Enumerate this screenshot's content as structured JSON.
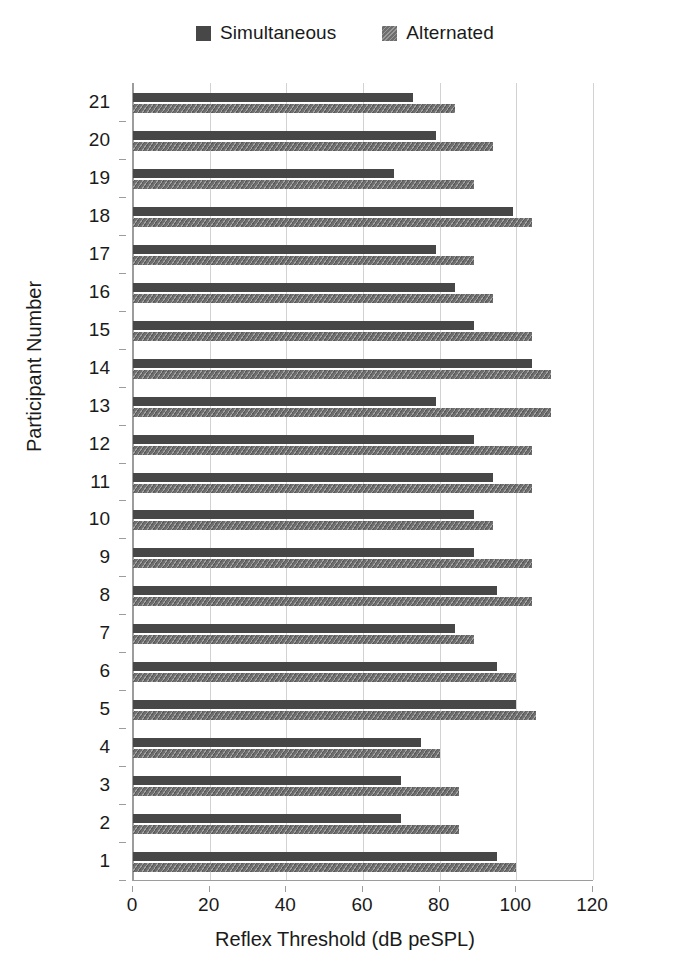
{
  "chart_data": {
    "type": "bar",
    "orientation": "horizontal",
    "title": "",
    "xlabel": "Reflex Threshold (dB peSPL)",
    "ylabel": "Participant Number",
    "xlim": [
      0,
      120
    ],
    "xticks": [
      0,
      20,
      40,
      60,
      80,
      100,
      120
    ],
    "grid": true,
    "legend_position": "top-center",
    "categories": [
      "1",
      "2",
      "3",
      "4",
      "5",
      "6",
      "7",
      "8",
      "9",
      "10",
      "11",
      "12",
      "13",
      "14",
      "15",
      "16",
      "17",
      "18",
      "19",
      "20",
      "21"
    ],
    "series": [
      {
        "name": "Simultaneous",
        "color": "#474747",
        "values": [
          95,
          70,
          70,
          75,
          100,
          95,
          84,
          95,
          89,
          89,
          94,
          89,
          79,
          104,
          89,
          84,
          79,
          99,
          68,
          79,
          73
        ]
      },
      {
        "name": "Alternated",
        "color": "#6f6f6f",
        "values": [
          100,
          85,
          85,
          80,
          105,
          100,
          89,
          104,
          104,
          94,
          104,
          104,
          109,
          109,
          104,
          94,
          89,
          104,
          89,
          94,
          84
        ]
      }
    ]
  },
  "legend": {
    "entries": [
      {
        "label": "Simultaneous",
        "swatch": "legend-swatch-simultaneous"
      },
      {
        "label": "Alternated",
        "swatch": "legend-swatch-alternated"
      }
    ]
  },
  "axes": {
    "x_title": "Reflex Threshold (dB peSPL)",
    "y_title": "Participant Number",
    "x_tick_labels": [
      "0",
      "20",
      "40",
      "60",
      "80",
      "100",
      "120"
    ],
    "y_tick_labels": [
      "1",
      "2",
      "3",
      "4",
      "5",
      "6",
      "7",
      "8",
      "9",
      "10",
      "11",
      "12",
      "13",
      "14",
      "15",
      "16",
      "17",
      "18",
      "19",
      "20",
      "21"
    ]
  },
  "colors": {
    "simultaneous": "#474747",
    "alternated": "#6f6f6f",
    "gridline": "#d2d2d2",
    "axis": "#9c9c9c",
    "text": "#1a1a1a",
    "background": "#ffffff"
  }
}
